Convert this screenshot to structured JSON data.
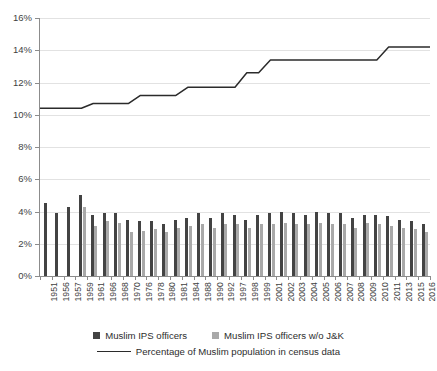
{
  "chart_data": {
    "type": "bar",
    "title": "",
    "subtitle": "",
    "xlabel": "",
    "ylabel": "",
    "ylim": [
      0,
      16
    ],
    "ytick_labels": [
      "0%",
      "2%",
      "4%",
      "6%",
      "8%",
      "10%",
      "12%",
      "14%",
      "16%"
    ],
    "ytick_values": [
      0,
      2,
      4,
      6,
      8,
      10,
      12,
      14,
      16
    ],
    "grid": true,
    "legend_position": "bottom",
    "categories": [
      "1951",
      "1956",
      "1957",
      "1959",
      "1961",
      "1966",
      "1968",
      "1970",
      "1976",
      "1978",
      "1980",
      "1981",
      "1984",
      "1988",
      "1990",
      "1992",
      "1997",
      "1998",
      "1999",
      "2001",
      "2002",
      "2003",
      "2004",
      "2005",
      "2006",
      "2007",
      "2008",
      "2009",
      "2010",
      "2011",
      "2013",
      "2015",
      "2016"
    ],
    "series": [
      {
        "name": "Muslim IPS officers",
        "type": "bar",
        "color": "#434343",
        "values": [
          4.5,
          3.9,
          4.3,
          5.0,
          3.8,
          3.9,
          3.9,
          3.5,
          3.4,
          3.4,
          3.2,
          3.5,
          3.6,
          3.9,
          3.6,
          3.9,
          3.8,
          3.5,
          3.8,
          3.9,
          4.0,
          3.9,
          3.8,
          4.0,
          3.9,
          3.9,
          3.6,
          3.8,
          3.8,
          3.7,
          3.5,
          3.4,
          3.2
        ]
      },
      {
        "name": "Muslim IPS officers w/o J&K",
        "type": "bar",
        "color": "#a9a9a9",
        "values": [
          null,
          null,
          null,
          4.3,
          3.1,
          3.4,
          3.3,
          2.7,
          2.8,
          2.9,
          2.7,
          3.0,
          3.1,
          3.2,
          3.0,
          3.2,
          3.2,
          3.0,
          3.2,
          3.2,
          3.3,
          3.2,
          3.2,
          3.3,
          3.2,
          3.2,
          3.0,
          3.3,
          3.2,
          3.1,
          3.0,
          2.9,
          2.7
        ]
      },
      {
        "name": "Percentage of Muslim population in census data",
        "type": "line",
        "color": "#2b2b2b",
        "values": [
          10.4,
          10.4,
          10.4,
          10.4,
          10.7,
          10.7,
          10.7,
          10.7,
          11.2,
          11.2,
          11.2,
          11.2,
          11.7,
          11.7,
          11.7,
          11.7,
          11.7,
          12.6,
          12.6,
          13.4,
          13.4,
          13.4,
          13.4,
          13.4,
          13.4,
          13.4,
          13.4,
          13.4,
          13.4,
          14.2,
          14.2,
          14.2,
          14.2
        ]
      }
    ]
  },
  "legend": {
    "items": [
      {
        "label": "Muslim IPS officers",
        "marker": "dark"
      },
      {
        "label": "Muslim IPS officers w/o J&K",
        "marker": "light"
      },
      {
        "label": "Percentage of Muslim population in census data",
        "marker": "line"
      }
    ]
  }
}
